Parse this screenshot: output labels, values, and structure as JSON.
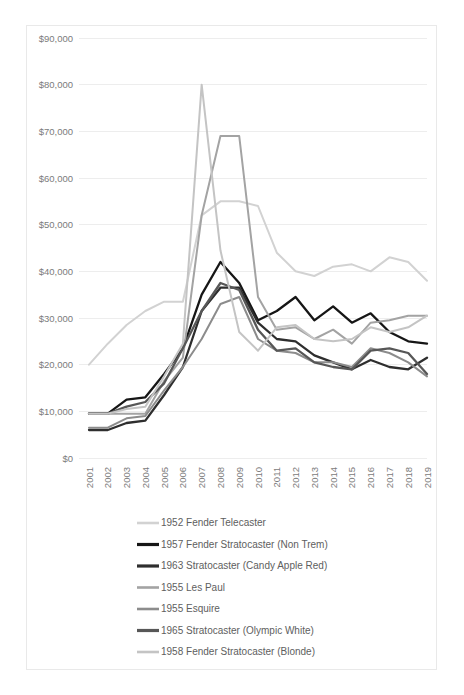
{
  "chart_data": {
    "type": "line",
    "title": "",
    "xlabel": "",
    "ylabel": "",
    "ylim": [
      0,
      90000
    ],
    "ytick_values": [
      0,
      10000,
      20000,
      30000,
      40000,
      50000,
      60000,
      70000,
      80000,
      90000
    ],
    "ytick_labels": [
      "$0",
      "$10,000",
      "$20,000",
      "$30,000",
      "$40,000",
      "$50,000",
      "$60,000",
      "$70,000",
      "$80,000",
      "$90,000"
    ],
    "grid": true,
    "legend_position": "bottom",
    "categories": [
      "2001",
      "2002",
      "2003",
      "2004",
      "2005",
      "2006",
      "2007",
      "2008",
      "2009",
      "2010",
      "2011",
      "2012",
      "2013",
      "2014",
      "2015",
      "2016",
      "2017",
      "2018",
      "2019"
    ],
    "series": [
      {
        "name": "1952 Fender Telecaster",
        "color": "#d2d2d2",
        "width": 2.0,
        "values": [
          20000,
          24500,
          28500,
          31500,
          33500,
          33500,
          52000,
          55000,
          55000,
          54000,
          44000,
          40000,
          39000,
          41000,
          41500,
          40000,
          43000,
          42000,
          38000
        ]
      },
      {
        "name": "1957 Fender Stratocaster (Non Trem)",
        "color": "#161616",
        "width": 2.3,
        "values": [
          9500,
          9500,
          12500,
          13000,
          18000,
          23500,
          35000,
          42000,
          37500,
          29500,
          31500,
          34500,
          29500,
          32500,
          29000,
          31000,
          27000,
          25000,
          24500
        ]
      },
      {
        "name": "1963 Stratocaster (Candy Apple Red)",
        "color": "#2e2e2e",
        "width": 2.3,
        "values": [
          6000,
          6000,
          7500,
          8000,
          13500,
          19500,
          31500,
          36500,
          36500,
          29000,
          25500,
          25000,
          22000,
          20500,
          19000,
          21000,
          19500,
          19000,
          21500
        ]
      },
      {
        "name": "1955 Les Paul",
        "color": "#a3a3a3",
        "width": 2.0,
        "values": [
          9500,
          9500,
          9500,
          9500,
          16500,
          21500,
          52000,
          69000,
          69000,
          34500,
          27500,
          28000,
          25500,
          27500,
          24500,
          29000,
          29500,
          30500,
          30500
        ]
      },
      {
        "name": "1955 Esquire",
        "color": "#8c8c8c",
        "width": 2.0,
        "values": [
          6500,
          6500,
          8500,
          9000,
          14500,
          19500,
          25500,
          33000,
          34500,
          25500,
          23000,
          22500,
          20500,
          20500,
          19500,
          23500,
          22500,
          20500,
          17500
        ]
      },
      {
        "name": "1965 Stratocaster (Olympic White)",
        "color": "#575757",
        "width": 2.3,
        "values": [
          9500,
          9500,
          11000,
          12000,
          16000,
          23500,
          31500,
          37500,
          36000,
          27500,
          23000,
          23500,
          20500,
          19500,
          19000,
          23000,
          23500,
          22500,
          18000
        ]
      },
      {
        "name": "1958 Fender Stratocaster (Blonde)",
        "color": "#c4c4c4",
        "width": 2.0,
        "values": [
          9500,
          9500,
          10500,
          11000,
          17500,
          24500,
          80000,
          44500,
          27000,
          23000,
          28000,
          28500,
          25500,
          25000,
          25500,
          28000,
          27000,
          28000,
          30500
        ]
      }
    ]
  },
  "legend": {
    "items": [
      {
        "label": "1952 Fender Telecaster",
        "color": "#d2d2d2"
      },
      {
        "label": "1957 Fender Stratocaster (Non Trem)",
        "color": "#161616"
      },
      {
        "label": "1963 Stratocaster (Candy Apple Red)",
        "color": "#2e2e2e"
      },
      {
        "label": "1955 Les Paul",
        "color": "#a3a3a3"
      },
      {
        "label": "1955 Esquire",
        "color": "#8c8c8c"
      },
      {
        "label": "1965 Stratocaster (Olympic White)",
        "color": "#575757"
      },
      {
        "label": "1958 Fender Stratocaster (Blonde)",
        "color": "#c4c4c4"
      }
    ]
  },
  "style": {
    "grid_color": "#ededed",
    "tick_text_color": "#7b7b7b",
    "legend_text_color": "#5e5e5e",
    "frame_color": "#e9e9e9",
    "background": "#ffffff"
  }
}
